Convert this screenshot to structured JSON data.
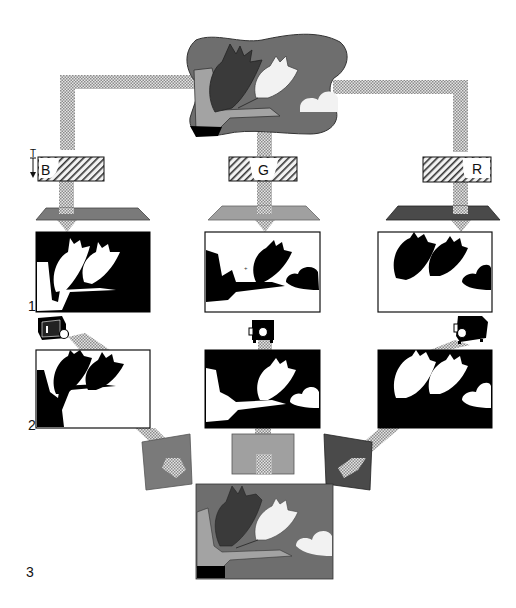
{
  "diagram": {
    "type": "color-separation-process",
    "colors": {
      "pipe_dots": "#9a9a9a",
      "scene_bg": "#6e6e6e",
      "dark_tulip": "#3a3a3a",
      "stem": "#a3a3a3",
      "white": "#f4f4f4",
      "black": "#000000",
      "filter_blue_gray": "#7c7c7c",
      "filter_green_gray": "#9d9d9d",
      "filter_red_gray": "#4a4a4a"
    },
    "source_image": {
      "label": "original scene with two tulips and a cloud"
    },
    "filters": [
      {
        "id": "blue",
        "label": "B",
        "arrow_label": "T"
      },
      {
        "id": "green",
        "label": "G"
      },
      {
        "id": "red",
        "label": "R"
      }
    ],
    "stage_labels": [
      {
        "id": "stage-1",
        "label": "1"
      },
      {
        "id": "stage-2",
        "label": "2"
      },
      {
        "id": "stage-3",
        "label": "3"
      }
    ],
    "negatives": [
      {
        "filter": "B",
        "description": "negative through blue filter"
      },
      {
        "filter": "G",
        "description": "negative through green filter"
      },
      {
        "filter": "R",
        "description": "negative through red filter"
      }
    ],
    "positives": [
      {
        "filter": "B",
        "description": "positive from blue negative"
      },
      {
        "filter": "G",
        "description": "positive from green negative"
      },
      {
        "filter": "R",
        "description": "positive from red negative"
      }
    ],
    "result": {
      "label": "recombined full-color reproduction"
    }
  }
}
